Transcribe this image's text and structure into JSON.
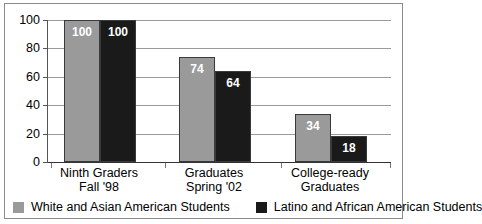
{
  "chart_data": {
    "type": "bar",
    "title": "",
    "subtitle": "",
    "xlabel": "",
    "ylabel": "",
    "ylim": [
      0,
      100
    ],
    "yticks": [
      "0",
      "20",
      "40",
      "60",
      "80",
      "100"
    ],
    "ytick_values": [
      0,
      20,
      40,
      60,
      80,
      100
    ],
    "grid": true,
    "legend_position": "bottom",
    "categories": [
      "Ninth Graders Fall '98",
      "Graduates Spring '02",
      "College-ready Graduates"
    ],
    "category_lines": [
      [
        "Ninth Graders",
        "Fall '98"
      ],
      [
        "Graduates",
        "Spring '02"
      ],
      [
        "College-ready",
        "Graduates"
      ]
    ],
    "series": [
      {
        "name": "White and Asian American Students",
        "color": "#9a9a9a",
        "values": [
          100,
          74,
          34
        ],
        "labels": [
          "100",
          "74",
          "34"
        ]
      },
      {
        "name": "Latino and African American Students",
        "color": "#1a1a1a",
        "values": [
          100,
          64,
          18
        ],
        "labels": [
          "100",
          "64",
          "18"
        ]
      }
    ]
  },
  "legend": {
    "items": [
      {
        "label": "White and Asian American Students",
        "swatch": "gray-swatch-icon"
      },
      {
        "label": "Latino and African American Students",
        "swatch": "black-swatch-icon"
      }
    ]
  }
}
